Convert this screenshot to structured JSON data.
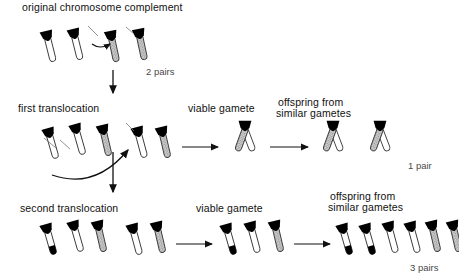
{
  "diagram": {
    "title_text": "original chromosome complement",
    "type": "chromosome-translocation-diagram",
    "background": "#ffffff",
    "ink": "#111111"
  },
  "labels": {
    "original_complement": "original chromosome complement",
    "first_translocation": "first translocation",
    "second_translocation": "second translocation",
    "viable_gamete_1": "viable gamete",
    "viable_gamete_2": "viable gamete",
    "offspring_1_line1": "offspring from",
    "offspring_1_line2": "similar gametes",
    "offspring_2_line1": "offspring from",
    "offspring_2_line2": "similar gametes"
  },
  "counts": {
    "row1": "2 pairs",
    "row2": "1 pair",
    "row3": "3 pairs"
  },
  "colors": {
    "black": "#000000",
    "white": "#ffffff",
    "stipple_fill": "#c9c9c9",
    "outline": "#333333",
    "count_text": "#4a4a4a"
  },
  "rows": [
    {
      "name": "original-complement",
      "label": "original chromosome complement",
      "count": "2 pairs",
      "groups": [
        {
          "name": "parent-karyotype",
          "chromosomes": [
            {
              "fill": "white",
              "tip": "none",
              "cap": "black"
            },
            {
              "fill": "white",
              "tip": "none",
              "cap": "black"
            },
            {
              "fill": "stipple",
              "tip": "none",
              "cap": "black"
            },
            {
              "fill": "stipple",
              "tip": "none",
              "cap": "black"
            }
          ]
        }
      ]
    },
    {
      "name": "first-translocation",
      "label": "first translocation",
      "count": "1 pair",
      "groups": [
        {
          "name": "translocation-karyotype",
          "chromosomes": [
            {
              "fill": "white",
              "tip": "none",
              "cap": "black"
            },
            {
              "fill": "white",
              "tip": "none",
              "cap": "black"
            },
            {
              "fill": "stipple",
              "tip": "none",
              "cap": "black"
            }
          ]
        },
        {
          "name": "fusion-product",
          "chromosomes": [
            {
              "fill": "white",
              "tip": "none",
              "cap": "black"
            },
            {
              "fill": "stipple",
              "tip": "none",
              "cap": "black"
            }
          ]
        },
        {
          "name": "viable-gamete",
          "label": "viable gamete",
          "chromosomes": [
            {
              "fill": "fusion-v",
              "left": "white",
              "right": "stipple",
              "cap": "black"
            }
          ]
        },
        {
          "name": "offspring",
          "label": "offspring from similar gametes",
          "chromosomes": [
            {
              "fill": "fusion-v",
              "left": "white",
              "right": "stipple",
              "cap": "black"
            },
            {
              "fill": "fusion-v",
              "left": "white",
              "right": "stipple",
              "cap": "black"
            }
          ]
        }
      ]
    },
    {
      "name": "second-translocation",
      "label": "second translocation",
      "count": "3 pairs",
      "groups": [
        {
          "name": "translocation-karyotype",
          "chromosomes": [
            {
              "fill": "white",
              "tip": "black",
              "cap": "black"
            },
            {
              "fill": "stipple",
              "tip": "none",
              "cap": "black"
            }
          ]
        },
        {
          "name": "second-pair",
          "chromosomes": [
            {
              "fill": "white",
              "tip": "none",
              "cap": "black"
            },
            {
              "fill": "stipple",
              "tip": "none",
              "cap": "black"
            }
          ]
        },
        {
          "name": "viable-gamete",
          "label": "viable gamete",
          "chromosomes": [
            {
              "fill": "white",
              "tip": "black",
              "cap": "black"
            },
            {
              "fill": "white",
              "tip": "none",
              "cap": "black"
            },
            {
              "fill": "stipple",
              "tip": "none",
              "cap": "black"
            }
          ]
        },
        {
          "name": "offspring",
          "label": "offspring from similar gametes",
          "chromosomes": [
            {
              "fill": "white",
              "tip": "black",
              "cap": "black"
            },
            {
              "fill": "white",
              "tip": "black",
              "cap": "black"
            },
            {
              "fill": "white",
              "tip": "none",
              "cap": "black"
            },
            {
              "fill": "white",
              "tip": "none",
              "cap": "black"
            },
            {
              "fill": "stipple",
              "tip": "none",
              "cap": "black"
            },
            {
              "fill": "stipple",
              "tip": "none",
              "cap": "black"
            }
          ]
        }
      ]
    }
  ],
  "arrows": [
    {
      "name": "down-arrow-row1-to-row2",
      "kind": "straight-vertical"
    },
    {
      "name": "exchange-arrow-row1",
      "kind": "short-curved"
    },
    {
      "name": "curved-arrow-row2",
      "kind": "long-curved"
    },
    {
      "name": "down-arrow-row2-to-row3",
      "kind": "straight-vertical"
    },
    {
      "name": "gamete-arrow-row2",
      "kind": "straight-horizontal"
    },
    {
      "name": "offspring-arrow-row2",
      "kind": "straight-horizontal"
    },
    {
      "name": "gamete-arrow-row3",
      "kind": "straight-horizontal"
    },
    {
      "name": "offspring-arrow-row3",
      "kind": "straight-horizontal"
    }
  ]
}
